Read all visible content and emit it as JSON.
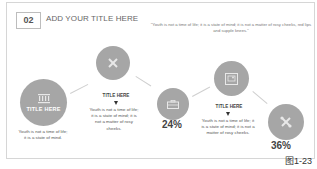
{
  "header": {
    "number": "02",
    "title": "ADD YOUR TITLE HERE"
  },
  "quote": "\"Youth is not a time of life; it is a state of mind; it is not a matter of rosy cheeks, red lips and supple knees.\"",
  "nodes": [
    {
      "icon": "building-icon",
      "label": "TITLE HERE",
      "text": "Youth is not a time of life; it is a state of mind."
    },
    {
      "icon": "pencil-ruler-icon",
      "title": "TITLE HERE",
      "text": "Youth is not a time of life; it is a state of mind; it is not a matter of rosy cheeks."
    },
    {
      "icon": "briefcase-icon",
      "value": "24%"
    },
    {
      "icon": "picture-frame-icon",
      "title": "TITLE HERE",
      "text": "Youth is not a time of life; it is a state of mind; it is not a matter of rosy cheeks."
    },
    {
      "icon": "tools-icon",
      "value": "36%"
    }
  ],
  "figure_label": "图1-23",
  "colors": {
    "circle": "#a6a6a6",
    "border": "#d6d6d6",
    "text": "#444444"
  }
}
